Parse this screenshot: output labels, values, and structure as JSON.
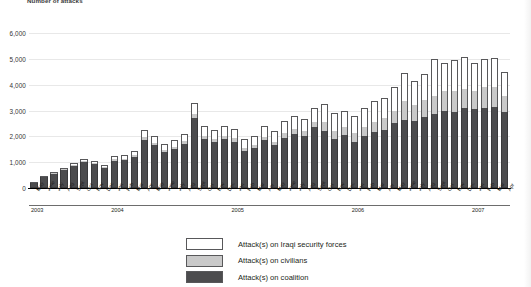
{
  "chart_data": {
    "type": "bar",
    "stacked": true,
    "title": "Number of attacks",
    "xlabel": "",
    "ylabel": "",
    "ylim": [
      0,
      6000
    ],
    "ytick_labels": [
      "0",
      "1,000",
      "2,000",
      "3,000",
      "4,000",
      "5,000",
      "6,000"
    ],
    "ytick_values": [
      0,
      1000,
      2000,
      3000,
      4000,
      5000,
      6000
    ],
    "grid": true,
    "legend_position": "bottom-center",
    "categories": [
      "May",
      "June",
      "July",
      "Aug",
      "Sept",
      "Oct",
      "Nov",
      "Dec",
      "Jan",
      "Feb",
      "Mar",
      "Apr",
      "May",
      "June",
      "July",
      "Aug",
      "Sept",
      "Oct",
      "Nov",
      "Dec",
      "Jan",
      "Feb",
      "Mar",
      "Apr",
      "May",
      "June",
      "July",
      "Aug",
      "Sept",
      "Oct",
      "Nov",
      "Dec",
      "Jan",
      "Feb",
      "Mar",
      "Apr",
      "May",
      "June",
      "July",
      "Aug",
      "Sept",
      "Oct",
      "Nov",
      "Dec",
      "Jan",
      "Feb",
      "Mar",
      "Apr"
    ],
    "year_bands": [
      {
        "label": "2003",
        "start_index": 0,
        "count": 8
      },
      {
        "label": "2004",
        "start_index": 8,
        "count": 12
      },
      {
        "label": "2005",
        "start_index": 20,
        "count": 12
      },
      {
        "label": "2006",
        "start_index": 32,
        "count": 12
      },
      {
        "label": "2007",
        "start_index": 44,
        "count": 4
      }
    ],
    "series": [
      {
        "name": "Attack(s) on coalition",
        "color": "#4c4c4e",
        "values": [
          180,
          420,
          550,
          700,
          850,
          1000,
          930,
          780,
          1050,
          1080,
          1200,
          1850,
          1650,
          1400,
          1500,
          1700,
          2700,
          1900,
          1780,
          1900,
          1800,
          1450,
          1550,
          1850,
          1650,
          1950,
          2100,
          2000,
          2350,
          2200,
          1900,
          2050,
          1800,
          2000,
          2150,
          2250,
          2500,
          2650,
          2600,
          2750,
          2850,
          3000,
          2950,
          3100,
          3050,
          3100,
          3150,
          2950
        ]
      },
      {
        "name": "Attack(s) on civilians",
        "color": "#c9c9c9",
        "values": [
          10,
          20,
          30,
          30,
          40,
          50,
          50,
          40,
          60,
          60,
          70,
          110,
          100,
          90,
          100,
          110,
          150,
          120,
          110,
          130,
          120,
          110,
          120,
          140,
          150,
          180,
          200,
          190,
          220,
          350,
          320,
          300,
          330,
          380,
          420,
          450,
          500,
          700,
          600,
          650,
          700,
          750,
          800,
          720,
          700,
          800,
          750,
          600
        ]
      },
      {
        "name": "Attack(s) on Iraqi security forces",
        "color": "#ffffff",
        "values": [
          10,
          20,
          30,
          40,
          60,
          80,
          70,
          60,
          140,
          150,
          180,
          290,
          250,
          210,
          250,
          290,
          450,
          380,
          350,
          370,
          380,
          340,
          360,
          410,
          400,
          470,
          500,
          480,
          530,
          700,
          680,
          650,
          670,
          720,
          780,
          800,
          900,
          1100,
          950,
          1000,
          1450,
          1100,
          1200,
          1250,
          1100,
          1100,
          1150,
          950
        ]
      }
    ],
    "legend": [
      {
        "label": "Attack(s) on Iraqi security forces",
        "swatch": "white"
      },
      {
        "label": "Attack(s) on civilians",
        "swatch": "light-gray"
      },
      {
        "label": "Attack(s) on coalition",
        "swatch": "dark-gray"
      }
    ],
    "colors": {
      "coalition": "#4c4c4e",
      "civilians": "#c9c9c9",
      "iraqi_security_forces": "#ffffff",
      "outline": "#58585a",
      "gridline": "#e8e8e8",
      "axis": "#000000",
      "text": "#231f20"
    }
  }
}
